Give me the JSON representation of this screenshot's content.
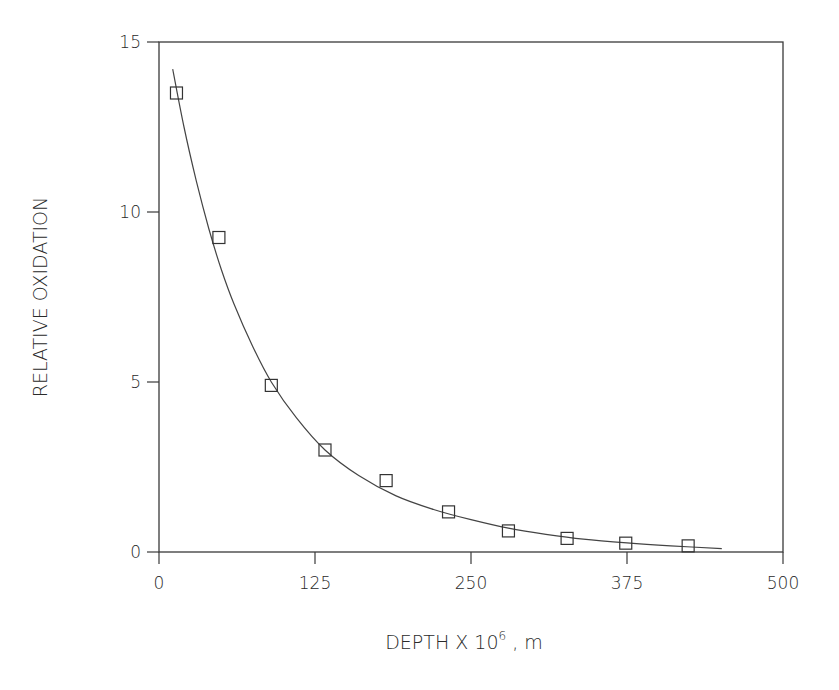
{
  "chart_data": {
    "type": "scatter",
    "title": "",
    "xlabel": "DEPTH X 10^6 , m",
    "xlabel_parts": {
      "main": "DEPTH X 10",
      "superscript": "6",
      "suffix": " , m"
    },
    "ylabel": "RELATIVE OXIDATION",
    "xlim": [
      0,
      500
    ],
    "ylim": [
      0,
      15
    ],
    "x_ticks": [
      0,
      125,
      250,
      375,
      500
    ],
    "x_tick_labels": [
      "0",
      "125",
      "250",
      "375",
      "500"
    ],
    "y_ticks": [
      0,
      5,
      10,
      15
    ],
    "y_tick_labels": [
      "0",
      "5",
      "10",
      "15"
    ],
    "grid": false,
    "legend": null,
    "series": [
      {
        "name": "Measured",
        "marker": "open-square",
        "points": [
          {
            "x": 14,
            "y": 13.5
          },
          {
            "x": 48,
            "y": 9.25
          },
          {
            "x": 90,
            "y": 4.9
          },
          {
            "x": 133,
            "y": 3.0
          },
          {
            "x": 182,
            "y": 2.1
          },
          {
            "x": 232,
            "y": 1.18
          },
          {
            "x": 280,
            "y": 0.62
          },
          {
            "x": 327,
            "y": 0.4
          },
          {
            "x": 374,
            "y": 0.26
          },
          {
            "x": 424,
            "y": 0.18
          }
        ]
      },
      {
        "name": "Fitted curve",
        "style": "line",
        "points": [
          {
            "x": 11,
            "y": 14.2
          },
          {
            "x": 20,
            "y": 12.5
          },
          {
            "x": 30,
            "y": 10.9
          },
          {
            "x": 40,
            "y": 9.5
          },
          {
            "x": 50,
            "y": 8.3
          },
          {
            "x": 60,
            "y": 7.3
          },
          {
            "x": 75,
            "y": 6.05
          },
          {
            "x": 90,
            "y": 5.0
          },
          {
            "x": 110,
            "y": 3.95
          },
          {
            "x": 133,
            "y": 3.0
          },
          {
            "x": 160,
            "y": 2.25
          },
          {
            "x": 190,
            "y": 1.65
          },
          {
            "x": 220,
            "y": 1.25
          },
          {
            "x": 250,
            "y": 0.95
          },
          {
            "x": 280,
            "y": 0.7
          },
          {
            "x": 310,
            "y": 0.52
          },
          {
            "x": 340,
            "y": 0.38
          },
          {
            "x": 375,
            "y": 0.27
          },
          {
            "x": 410,
            "y": 0.18
          },
          {
            "x": 451,
            "y": 0.1
          }
        ]
      }
    ]
  }
}
